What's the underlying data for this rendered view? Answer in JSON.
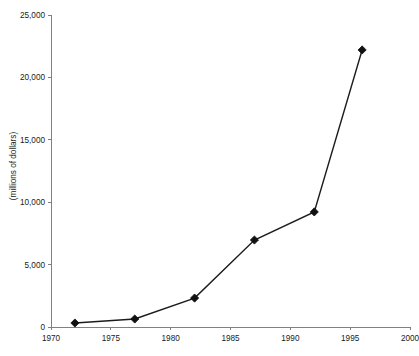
{
  "chart_data": {
    "type": "line",
    "title": "",
    "subtitle": "",
    "xlabel": "",
    "ylabel": "(millions of dollars)",
    "x": [
      1972,
      1977,
      1982,
      1987,
      1992,
      1996
    ],
    "values": [
      320,
      640,
      2320,
      6970,
      9220,
      22200
    ],
    "series": [
      {
        "name": "",
        "x": [
          1972,
          1977,
          1982,
          1987,
          1992,
          1996
        ],
        "values": [
          320,
          640,
          2320,
          6970,
          9220,
          22200
        ]
      }
    ],
    "xlim": [
      1970,
      2000
    ],
    "ylim": [
      0,
      25000
    ],
    "xticks": [
      1970,
      1975,
      1980,
      1985,
      1990,
      1995,
      2000
    ],
    "xtick_labels": [
      "1970",
      "1975",
      "1980",
      "1985",
      "1990",
      "1995",
      "2000"
    ],
    "yticks": [
      0,
      5000,
      10000,
      15000,
      20000,
      25000
    ],
    "ytick_labels": [
      "0",
      "5,000",
      "10,000",
      "15,000",
      "20,000",
      "25,000"
    ],
    "grid": false,
    "legend": false,
    "legend_position": "none",
    "marker": "diamond",
    "line_color": "#1c1c1c",
    "marker_color": "#111111",
    "axis_color": "#808080",
    "background_color": "#ffffff",
    "annotations": []
  }
}
